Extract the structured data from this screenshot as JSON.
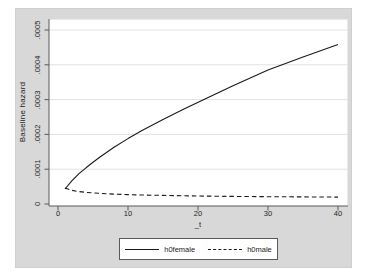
{
  "chart_data": {
    "type": "line",
    "title": "",
    "xlabel": "_t",
    "ylabel": "Baseline hazard",
    "xlim": [
      0,
      40
    ],
    "ylim": [
      0,
      0.0005
    ],
    "xticks": [
      0,
      10,
      20,
      30,
      40
    ],
    "xtick_labels": [
      "0",
      "10",
      "20",
      "30",
      "40"
    ],
    "yticks": [
      0,
      0.0001,
      0.0002,
      0.0003,
      0.0004,
      0.0005
    ],
    "ytick_labels": [
      "0",
      ".0001",
      ".0002",
      ".0003",
      ".0004",
      ".0005"
    ],
    "ytick_label_rotation": 90,
    "grid": "horizontal",
    "legend_position": "bottom-center",
    "series": [
      {
        "name": "h0female",
        "line_style": "solid",
        "color": "#1a1a1a",
        "x": [
          1,
          2,
          3,
          4,
          5,
          6,
          8,
          10,
          12,
          15,
          18,
          21,
          25,
          30,
          35,
          40
        ],
        "y": [
          4.3e-05,
          6.7e-05,
          8.7e-05,
          0.000104,
          0.00012,
          0.000135,
          0.000163,
          0.000188,
          0.000211,
          0.000243,
          0.000273,
          0.000302,
          0.00034,
          0.000385,
          0.000422,
          0.000458
        ]
      },
      {
        "name": "h0male",
        "line_style": "dashed",
        "color": "#1a1a1a",
        "x": [
          1,
          2,
          3,
          4,
          5,
          6,
          8,
          10,
          12,
          15,
          18,
          21,
          25,
          30,
          35,
          40
        ],
        "y": [
          4.6e-05,
          3.9e-05,
          3.57e-05,
          3.34e-05,
          3.18e-05,
          3.05e-05,
          2.85e-05,
          2.71e-05,
          2.6e-05,
          2.47e-05,
          2.37e-05,
          2.28e-05,
          2.19e-05,
          2.1e-05,
          2.03e-05,
          1.97e-05
        ]
      }
    ]
  },
  "legend": {
    "items": [
      {
        "label": "h0female",
        "line_style": "solid"
      },
      {
        "label": "h0male",
        "line_style": "dashed"
      }
    ]
  },
  "colors": {
    "figure_background": "#d8d8d8",
    "plot_background": "#ffffff",
    "gridline": "#e2e2e2",
    "axis": "#5a5a5a",
    "text": "#222222",
    "line": "#1a1a1a"
  }
}
